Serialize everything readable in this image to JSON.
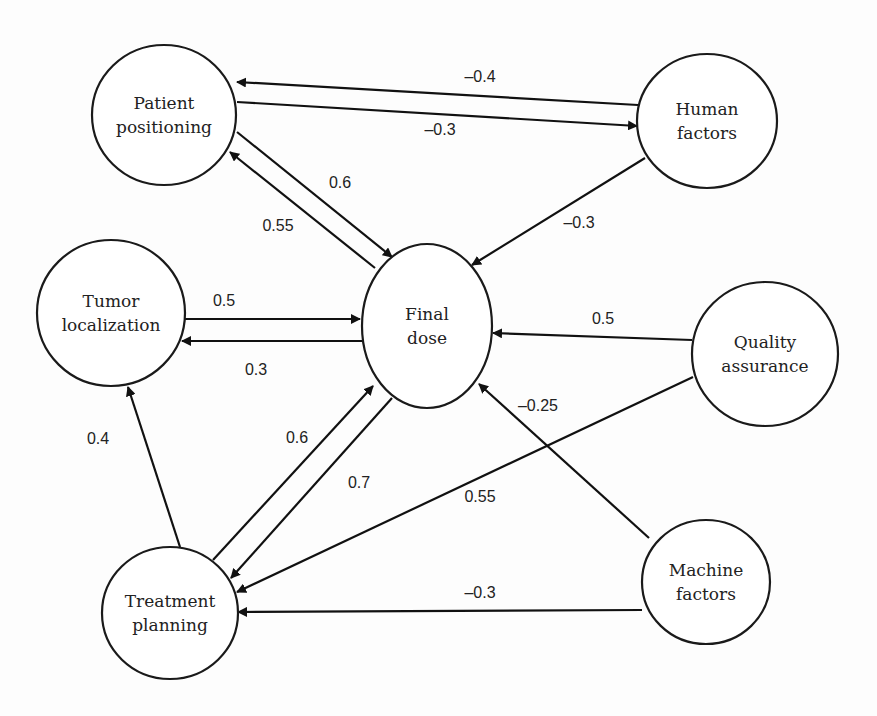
{
  "diagram": {
    "type": "causal-network",
    "nodes": [
      {
        "id": "patient_positioning",
        "lines": [
          "Patient",
          "positioning"
        ],
        "cx": 164,
        "cy": 115,
        "rx": 72,
        "ry": 70
      },
      {
        "id": "human_factors",
        "lines": [
          "Human",
          "factors"
        ],
        "cx": 707,
        "cy": 121,
        "rx": 70,
        "ry": 67
      },
      {
        "id": "tumor_localization",
        "lines": [
          "Tumor",
          "localization"
        ],
        "cx": 111,
        "cy": 313,
        "rx": 74,
        "ry": 73
      },
      {
        "id": "final_dose",
        "lines": [
          "Final",
          "dose"
        ],
        "cx": 427,
        "cy": 326,
        "rx": 65,
        "ry": 82
      },
      {
        "id": "quality_assurance",
        "lines": [
          "Quality",
          "assurance"
        ],
        "cx": 765,
        "cy": 354,
        "rx": 73,
        "ry": 72
      },
      {
        "id": "treatment_planning",
        "lines": [
          "Treatment",
          "planning"
        ],
        "cx": 170,
        "cy": 613,
        "rx": 68,
        "ry": 66
      },
      {
        "id": "machine_factors",
        "lines": [
          "Machine",
          "factors"
        ],
        "cx": 706,
        "cy": 582,
        "rx": 64,
        "ry": 62
      }
    ],
    "edges": [
      {
        "from": "human_factors",
        "to": "patient_positioning",
        "weight": "–0.4",
        "x1": 638,
        "y1": 105,
        "x2": 237,
        "y2": 82,
        "lx": 480,
        "ly": 82
      },
      {
        "from": "patient_positioning",
        "to": "human_factors",
        "weight": "–0.3",
        "x1": 237,
        "y1": 102,
        "x2": 637,
        "y2": 126,
        "lx": 440,
        "ly": 135
      },
      {
        "from": "patient_positioning",
        "to": "final_dose",
        "weight": "0.6",
        "x1": 237,
        "y1": 132,
        "x2": 392,
        "y2": 257,
        "lx": 340,
        "ly": 188
      },
      {
        "from": "final_dose",
        "to": "patient_positioning",
        "weight": "0.55",
        "x1": 375,
        "y1": 268,
        "x2": 230,
        "y2": 152,
        "lx": 278,
        "ly": 231
      },
      {
        "from": "human_factors",
        "to": "final_dose",
        "weight": "–0.3",
        "x1": 645,
        "y1": 158,
        "x2": 472,
        "y2": 265,
        "lx": 579,
        "ly": 228
      },
      {
        "from": "tumor_localization",
        "to": "final_dose",
        "weight": "0.5",
        "x1": 185,
        "y1": 319,
        "x2": 360,
        "y2": 319,
        "lx": 224,
        "ly": 306
      },
      {
        "from": "final_dose",
        "to": "tumor_localization",
        "weight": "0.3",
        "x1": 362,
        "y1": 341,
        "x2": 182,
        "y2": 341,
        "lx": 256,
        "ly": 375
      },
      {
        "from": "quality_assurance",
        "to": "final_dose",
        "weight": "0.5",
        "x1": 692,
        "y1": 340,
        "x2": 493,
        "y2": 333,
        "lx": 603,
        "ly": 324
      },
      {
        "from": "machine_factors",
        "to": "final_dose",
        "weight": "–0.25",
        "x1": 649,
        "y1": 538,
        "x2": 479,
        "y2": 384,
        "lx": 538,
        "ly": 411
      },
      {
        "from": "treatment_planning",
        "to": "tumor_localization",
        "weight": "0.4",
        "x1": 180,
        "y1": 547,
        "x2": 128,
        "y2": 387,
        "lx": 98,
        "ly": 444
      },
      {
        "from": "treatment_planning",
        "to": "final_dose",
        "weight": "0.6",
        "x1": 213,
        "y1": 560,
        "x2": 373,
        "y2": 386,
        "lx": 297,
        "ly": 443
      },
      {
        "from": "final_dose",
        "to": "treatment_planning",
        "weight": "0.7",
        "x1": 392,
        "y1": 398,
        "x2": 231,
        "y2": 578,
        "lx": 359,
        "ly": 488
      },
      {
        "from": "quality_assurance",
        "to": "treatment_planning",
        "weight": "0.55",
        "x1": 693,
        "y1": 377,
        "x2": 237,
        "y2": 592,
        "lx": 480,
        "ly": 502
      },
      {
        "from": "machine_factors",
        "to": "treatment_planning",
        "weight": "–0.3",
        "x1": 642,
        "y1": 610,
        "x2": 238,
        "y2": 612,
        "lx": 480,
        "ly": 598
      }
    ]
  }
}
